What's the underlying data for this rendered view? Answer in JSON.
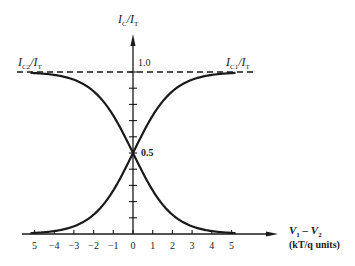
{
  "chart_data": {
    "type": "line",
    "title": "",
    "xlabel": "V1 - V2 (kT/q units)",
    "ylabel": "IC/IT",
    "xlim": [
      -5,
      5
    ],
    "ylim": [
      0,
      1.0
    ],
    "grid": false,
    "x_tick_labels": [
      "5",
      "-4",
      "-3",
      "-2",
      "-1",
      "0",
      "1",
      "2",
      "3",
      "4",
      "5"
    ],
    "x_ticks": [
      -5,
      -4,
      -3,
      -2,
      -1,
      0,
      1,
      2,
      3,
      4,
      5
    ],
    "y_tick_labels": [
      "0.5",
      "1.0"
    ],
    "y_ticks_minor_step": 0.1,
    "x": [
      -5,
      -4,
      -3,
      -2,
      -1,
      0,
      1,
      2,
      3,
      4,
      5
    ],
    "series": [
      {
        "name": "IC1/IT",
        "values": [
          0.007,
          0.018,
          0.047,
          0.119,
          0.269,
          0.5,
          0.731,
          0.881,
          0.953,
          0.982,
          0.993
        ]
      },
      {
        "name": "IC2/IT",
        "values": [
          0.993,
          0.982,
          0.953,
          0.881,
          0.731,
          0.5,
          0.269,
          0.119,
          0.047,
          0.018,
          0.007
        ]
      }
    ],
    "annotations": [
      {
        "text": "1.0",
        "note": "dashed asymptote line at IC/IT = 1.0"
      },
      {
        "text": "0.5",
        "note": "curves cross at V1 - V2 = 0"
      }
    ]
  },
  "labels": {
    "y_axis_title_main": "I",
    "y_axis_title_sub1": "C",
    "y_axis_title_mid": "/I",
    "y_axis_title_sub2": "T",
    "curve_left_main": "I",
    "curve_left_sub": "C2",
    "curve_left_mid": "/I",
    "curve_left_sub2": "T",
    "curve_right_main": "I",
    "curve_right_sub": "C1",
    "curve_right_mid": "/I",
    "curve_right_sub2": "T",
    "y_one": "1.0",
    "y_half": "0.5",
    "x_axis_title_line1_a": "V",
    "x_axis_title_line1_sub_a": "1",
    "x_axis_title_line1_op": " – ",
    "x_axis_title_line1_b": "V",
    "x_axis_title_line1_sub_b": "2",
    "x_axis_title_line2": "(kT/q units)"
  },
  "colors": {
    "ink": "#1a1a1a",
    "background": "#ffffff"
  }
}
